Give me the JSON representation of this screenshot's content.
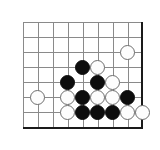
{
  "diagram": {
    "kind": "go-board-corner-diagram",
    "colors": {
      "background": "#ffffff",
      "grid_line": "#8a8a8a",
      "board_edge": "#1a1a1a",
      "black_stone": "#0d0d0d",
      "white_stone": "#fdfdfd",
      "white_stone_outline": "#6e6e6e"
    }
  },
  "board": {
    "grid_spacing": 15,
    "stone_diameter": 15,
    "origin_x": 22.5,
    "origin_y": 22,
    "columns": 8,
    "rows": 7,
    "vertical_lines_x": [
      22.5,
      37.5,
      52.5,
      67.5,
      82.5,
      97.5,
      112.5,
      127.5
    ],
    "horizontal_lines_y": [
      22,
      37,
      52,
      67,
      82,
      97,
      112
    ],
    "right_edge_x": 141,
    "bottom_edge_y": 127,
    "top_line_y": 22,
    "left_line_x": 22.5
  },
  "stones": [
    {
      "label": "white-stone-c8r3",
      "color": "white",
      "col": 8,
      "row": 3,
      "cx": 127.5,
      "cy": 52
    },
    {
      "label": "black-stone-c5r4",
      "color": "black",
      "col": 5,
      "row": 4,
      "cx": 82.5,
      "cy": 67
    },
    {
      "label": "white-stone-c6r4",
      "color": "white",
      "col": 6,
      "row": 4,
      "cx": 97.5,
      "cy": 67
    },
    {
      "label": "black-stone-c4r5",
      "color": "black",
      "col": 4,
      "row": 5,
      "cx": 67.5,
      "cy": 82
    },
    {
      "label": "black-stone-c6r5",
      "color": "black",
      "col": 6,
      "row": 5,
      "cx": 97.5,
      "cy": 82
    },
    {
      "label": "white-stone-c7r5",
      "color": "white",
      "col": 7,
      "row": 5,
      "cx": 112.5,
      "cy": 82
    },
    {
      "label": "white-stone-c2r6",
      "color": "white",
      "col": 2,
      "row": 6,
      "cx": 37.5,
      "cy": 97
    },
    {
      "label": "white-stone-c4r6",
      "color": "white",
      "col": 4,
      "row": 6,
      "cx": 67.5,
      "cy": 97
    },
    {
      "label": "black-stone-c5r6",
      "color": "black",
      "col": 5,
      "row": 6,
      "cx": 82.5,
      "cy": 97
    },
    {
      "label": "white-stone-c6r6",
      "color": "white",
      "col": 6,
      "row": 6,
      "cx": 97.5,
      "cy": 97
    },
    {
      "label": "white-stone-c7r6",
      "color": "white",
      "col": 7,
      "row": 6,
      "cx": 112.5,
      "cy": 97
    },
    {
      "label": "black-stone-c8r6",
      "color": "black",
      "col": 8,
      "row": 6,
      "cx": 127.5,
      "cy": 97
    },
    {
      "label": "white-stone-c4r7",
      "color": "white",
      "col": 4,
      "row": 7,
      "cx": 67.5,
      "cy": 112
    },
    {
      "label": "black-stone-c5r7",
      "color": "black",
      "col": 5,
      "row": 7,
      "cx": 82.5,
      "cy": 112
    },
    {
      "label": "black-stone-c6r7",
      "color": "black",
      "col": 6,
      "row": 7,
      "cx": 97.5,
      "cy": 112
    },
    {
      "label": "black-stone-c7r7",
      "color": "black",
      "col": 7,
      "row": 7,
      "cx": 112.5,
      "cy": 112
    },
    {
      "label": "white-stone-c8r7",
      "color": "white",
      "col": 8,
      "row": 7,
      "cx": 127.5,
      "cy": 112
    },
    {
      "label": "white-stone-offboard-r7",
      "color": "white",
      "col": 9,
      "row": 7,
      "cx": 142.5,
      "cy": 112
    }
  ]
}
